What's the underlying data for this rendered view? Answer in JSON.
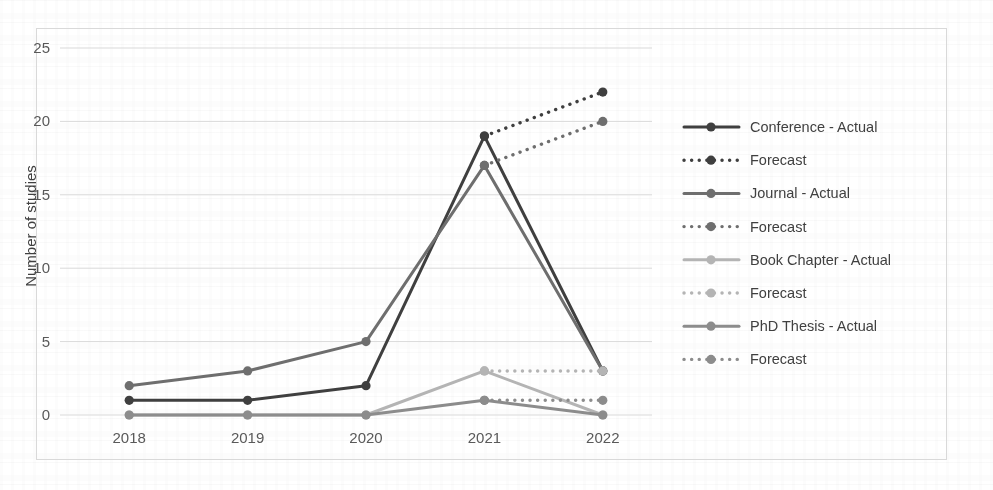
{
  "chart_data": {
    "type": "line",
    "title": "",
    "xlabel": "",
    "ylabel": "Number of studies",
    "categories": [
      "2018",
      "2019",
      "2020",
      "2021",
      "2022"
    ],
    "x_tick_labels": [
      "2018",
      "2019",
      "2020",
      "2021",
      "2022"
    ],
    "y_tick_labels": [
      "0",
      "5",
      "10",
      "15",
      "20",
      "25"
    ],
    "y_tick_values": [
      0,
      5,
      10,
      15,
      20,
      25
    ],
    "ylim": [
      0,
      25
    ],
    "grid": "horizontal",
    "legend_position": "right",
    "series": [
      {
        "name": "Conference - Actual",
        "style": "solid",
        "color": "#3f3f3f",
        "x": [
          "2018",
          "2019",
          "2020",
          "2021",
          "2022"
        ],
        "values": [
          1,
          1,
          2,
          19,
          3
        ]
      },
      {
        "name": "Forecast",
        "parent": "Conference",
        "style": "dotted",
        "color": "#3f3f3f",
        "x": [
          "2021",
          "2022"
        ],
        "values": [
          19,
          22
        ]
      },
      {
        "name": "Journal - Actual",
        "style": "solid",
        "color": "#6e6e6e",
        "x": [
          "2018",
          "2019",
          "2020",
          "2021",
          "2022"
        ],
        "values": [
          2,
          3,
          5,
          17,
          3
        ]
      },
      {
        "name": "Forecast",
        "parent": "Journal",
        "style": "dotted",
        "color": "#6e6e6e",
        "x": [
          "2021",
          "2022"
        ],
        "values": [
          17,
          20
        ]
      },
      {
        "name": "Book Chapter - Actual",
        "style": "solid",
        "color": "#b4b4b4",
        "x": [
          "2018",
          "2019",
          "2020",
          "2021",
          "2022"
        ],
        "values": [
          0,
          0,
          0,
          3,
          0
        ]
      },
      {
        "name": "Forecast",
        "parent": "Book Chapter",
        "style": "dotted",
        "color": "#b4b4b4",
        "x": [
          "2021",
          "2022"
        ],
        "values": [
          3,
          3
        ]
      },
      {
        "name": "PhD Thesis - Actual",
        "style": "solid",
        "color": "#8c8c8c",
        "x": [
          "2018",
          "2019",
          "2020",
          "2021",
          "2022"
        ],
        "values": [
          0,
          0,
          0,
          1,
          0
        ]
      },
      {
        "name": "Forecast",
        "parent": "PhD Thesis",
        "style": "dotted",
        "color": "#8c8c8c",
        "x": [
          "2021",
          "2022"
        ],
        "values": [
          1,
          1
        ]
      }
    ]
  },
  "legend": {
    "entries": [
      {
        "label": "Conference - Actual",
        "color": "#3f3f3f",
        "style": "solid"
      },
      {
        "label": "Forecast",
        "color": "#3f3f3f",
        "style": "dotted"
      },
      {
        "label": "Journal - Actual",
        "color": "#6e6e6e",
        "style": "solid"
      },
      {
        "label": "Forecast",
        "color": "#6e6e6e",
        "style": "dotted"
      },
      {
        "label": "Book Chapter - Actual",
        "color": "#b4b4b4",
        "style": "solid"
      },
      {
        "label": "Forecast",
        "color": "#b4b4b4",
        "style": "dotted"
      },
      {
        "label": "PhD Thesis - Actual",
        "color": "#8c8c8c",
        "style": "solid"
      },
      {
        "label": "Forecast",
        "color": "#8c8c8c",
        "style": "dotted"
      }
    ]
  },
  "colors": {
    "gridline": "#d9d9d9",
    "border": "#d9d9d9",
    "tick_text": "#595959",
    "axis_title": "#404040",
    "background": "#ffffff"
  }
}
